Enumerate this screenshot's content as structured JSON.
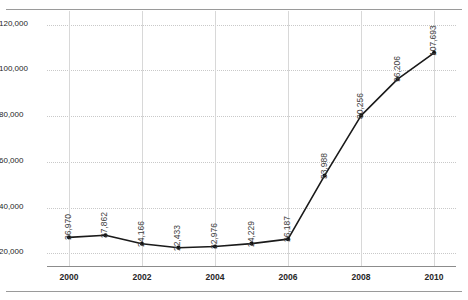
{
  "chart_data": {
    "type": "line",
    "title": "",
    "subtitle": "",
    "xlabel": "",
    "ylabel": "",
    "x": [
      2000,
      2001,
      2002,
      2003,
      2004,
      2005,
      2006,
      2007,
      2008,
      2009,
      2010
    ],
    "values": [
      26970,
      27862,
      24166,
      22433,
      22976,
      24229,
      26187,
      53988,
      80256,
      96206,
      107693
    ],
    "point_labels": [
      "26,970",
      "27,862",
      "24,166",
      "22,433",
      "22,976",
      "24,229",
      "26,187",
      "53,988",
      "80,256",
      "96,206",
      "107,693"
    ],
    "xtick_labels": [
      "2000",
      "2002",
      "2004",
      "2006",
      "2008",
      "2010"
    ],
    "xticks": [
      2000,
      2002,
      2004,
      2006,
      2008,
      2010
    ],
    "ytick_labels": [
      "20,000",
      "40,000",
      "60,000",
      "80,000",
      "100,000",
      "120,000"
    ],
    "yticks": [
      20000,
      40000,
      60000,
      80000,
      100000,
      120000
    ],
    "ylim": [
      14000,
      126000
    ],
    "xlim": [
      1999.4,
      2010.6
    ],
    "grid": {
      "horizontal": true,
      "vertical": true,
      "horizontal_style": "dotted",
      "vertical_style": "solid"
    },
    "legend": null,
    "legend_position": "none",
    "series": [
      {
        "name": "",
        "values": [
          26970,
          27862,
          24166,
          22433,
          22976,
          24229,
          26187,
          53988,
          80256,
          96206,
          107693
        ],
        "color": "#1a1a1a",
        "marker": "circle",
        "line_width": 1.6
      }
    ],
    "colors": {
      "line": "#1a1a1a",
      "marker": "#111111",
      "grid_horizontal": "#c9c9c9",
      "grid_vertical": "#d8d8d8",
      "axis": "#8c8c8c",
      "tick_text": "#262626",
      "label_text": "#3d3d3d",
      "frame_rule": "#9a9a9a",
      "background": "#ffffff"
    }
  }
}
